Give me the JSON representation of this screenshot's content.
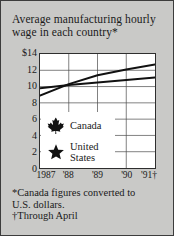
{
  "card": {
    "background_color": "#c9c9c7",
    "border_color": "#3c3c3c",
    "plot_background": "#ffffff",
    "line_color": "#111111"
  },
  "title": "Average manufacturing hourly wage in each country*",
  "footnotes": {
    "line1": "*Canada figures converted to",
    "line2": "U.S. dollars.",
    "line3": "†Through April"
  },
  "legend": {
    "items": [
      {
        "icon": "maple-leaf-icon",
        "label": "Canada"
      },
      {
        "icon": "star-icon",
        "label_line1": "United",
        "label_line2": "States"
      }
    ]
  },
  "chart_data": {
    "type": "line",
    "title": "Average manufacturing hourly wage in each country*",
    "xlabel": "",
    "ylabel": "",
    "x": [
      1987,
      1988,
      1989,
      1990,
      1991
    ],
    "categories": [
      "1987",
      "'88",
      "'89",
      "'90",
      "'91†"
    ],
    "ylim": [
      0,
      14
    ],
    "yticks": [
      0,
      2,
      4,
      6,
      8,
      10,
      12,
      14
    ],
    "ytick_labels": [
      "0",
      "2",
      "4",
      "6",
      "8",
      "10",
      "12",
      "$14"
    ],
    "grid": true,
    "grid_y_step": 2,
    "legend_position": "lower-left",
    "series": [
      {
        "name": "Canada",
        "icon": "maple-leaf-icon",
        "values": [
          8.9,
          10.3,
          11.4,
          12.1,
          12.7
        ]
      },
      {
        "name": "United States",
        "icon": "star-icon",
        "values": [
          9.8,
          10.2,
          10.5,
          10.8,
          11.1
        ]
      }
    ]
  }
}
